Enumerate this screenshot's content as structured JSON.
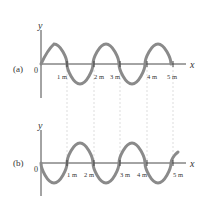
{
  "figure": {
    "panels": [
      {
        "id": "a",
        "label": "(a)",
        "origin_label": "0",
        "x_axis_label": "x",
        "y_axis_label": "y",
        "tick_labels": [
          "1 m",
          "2 m",
          "3 m",
          "4 m",
          "5 m"
        ],
        "description": "sine wave starting at origin going upward"
      },
      {
        "id": "b",
        "label": "(b)",
        "origin_label": "0",
        "x_axis_label": "x",
        "y_axis_label": "y",
        "tick_labels": [
          "1 m",
          "2 m",
          "3 m",
          "4 m",
          "5 m"
        ],
        "description": "sine wave starting at origin going downward (inverted)"
      }
    ],
    "colors": {
      "wave": "#8a8a8a",
      "axis": "#333333",
      "guide": "#c8c8c8"
    },
    "wavelength_m": 2
  }
}
